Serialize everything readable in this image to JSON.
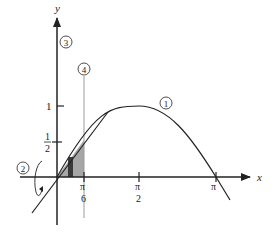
{
  "diagram": {
    "axes": {
      "x_label": "x",
      "y_label": "y",
      "x_ticks": [
        {
          "num": "π",
          "den": "6"
        },
        {
          "num": "π",
          "den": "2"
        },
        {
          "num": "π",
          "den": ""
        }
      ],
      "y_ticks": [
        {
          "num": "1",
          "den": ""
        },
        {
          "num": "1",
          "den": "2"
        }
      ]
    },
    "callouts": [
      {
        "id": "1",
        "label": "1",
        "refers_to": "curve y = sin x"
      },
      {
        "id": "2",
        "label": "2",
        "refers_to": "rotation arrow about y-axis"
      },
      {
        "id": "3",
        "label": "3",
        "refers_to": "y-axis (axis of rotation)"
      },
      {
        "id": "4",
        "label": "4",
        "refers_to": "vertical line x = π/6"
      }
    ],
    "regions": {
      "shaded_region": "area between y = x and x-axis from 0 to π/6",
      "strip": "dark vertical strip (representative rectangle)"
    },
    "colors": {
      "ink": "#222222",
      "shade": "#a6a6a6",
      "strip": "#3a3a3a",
      "guide_line": "#9a9a9a"
    }
  }
}
